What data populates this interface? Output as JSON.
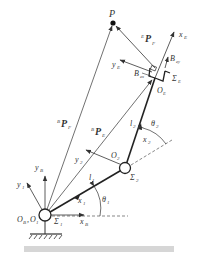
{
  "diagram": {
    "type": "two-link planar manipulator kinematics",
    "points": {
      "P": {
        "label": "P"
      },
      "base": {
        "label": "O",
        "sub1": "B",
        "sep": ",",
        "label2": "O",
        "sub2": "1",
        "frame": "Σ",
        "frame_sub": "1"
      },
      "joint2": {
        "label": "O",
        "sub": "2",
        "frame": "Σ",
        "frame_sub": "2"
      },
      "end_effector": {
        "label": "O",
        "sub": "E",
        "frame": "Σ",
        "frame_sub": "E"
      }
    },
    "links": {
      "l1": {
        "label": "l",
        "sub": "1"
      },
      "l2": {
        "label": "l",
        "sub": "2"
      }
    },
    "angles": {
      "theta1": {
        "label": "θ",
        "sub": "1"
      },
      "theta2": {
        "label": "θ",
        "sub": "2"
      }
    },
    "axes": {
      "xB": {
        "label": "x",
        "sub": "B"
      },
      "yB": {
        "label": "y",
        "sub": "B"
      },
      "x1": {
        "label": "x",
        "sub": "1"
      },
      "y1": {
        "label": "y",
        "sub": "1"
      },
      "x2": {
        "label": "x",
        "sub": "2"
      },
      "y2": {
        "label": "y",
        "sub": "2"
      },
      "xE": {
        "label": "x",
        "sub": "E"
      },
      "yE": {
        "label": "y",
        "sub": "E"
      }
    },
    "vectors": {
      "BPF": {
        "sup": "B",
        "label": "P",
        "sub": "F"
      },
      "BPE": {
        "sup": "B",
        "label": "P",
        "sub": "E"
      },
      "EPF": {
        "sup": "E",
        "label": "P",
        "sub": "F"
      }
    },
    "bases": {
      "Bex": {
        "label": "B",
        "sub": "ex"
      },
      "Bey": {
        "label": "B",
        "sub": "ey"
      }
    }
  },
  "caption": {
    "text": ""
  },
  "colors": {
    "line": "#333333",
    "link": "#222222",
    "dash": "#555555",
    "caption_bar": "#d6d6d6"
  }
}
